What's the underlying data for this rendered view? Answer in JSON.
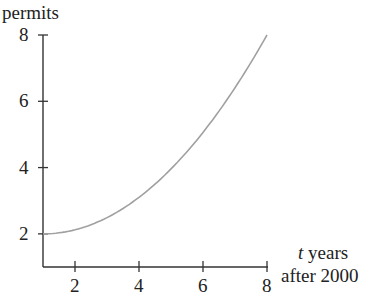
{
  "chart_data": {
    "type": "line",
    "title": "",
    "ylabel": "permits",
    "xlabel_italic": "t",
    "xlabel_line1": " years",
    "xlabel_line2": "after 2000",
    "x_ticks": [
      "2",
      "4",
      "6",
      "8"
    ],
    "y_ticks": [
      "2",
      "4",
      "6",
      "8"
    ],
    "xlim": [
      1,
      8
    ],
    "ylim": [
      1,
      8
    ],
    "grid": false,
    "legend": null,
    "series": [
      {
        "name": "permits",
        "x": [
          1,
          2,
          3,
          4,
          5,
          6,
          7,
          8
        ],
        "y": [
          2.0,
          2.12,
          2.49,
          3.1,
          3.96,
          5.06,
          6.41,
          8.0
        ]
      }
    ],
    "colors": {
      "curve": "#a0a0a0",
      "axis": "#333333"
    }
  }
}
